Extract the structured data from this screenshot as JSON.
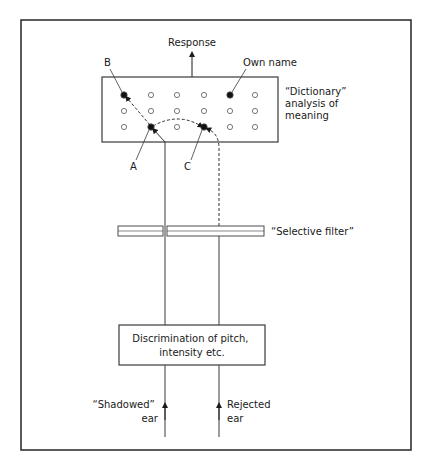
{
  "diagram": {
    "type": "Broadbent/Treisman selective attention model",
    "labels": {
      "response": "Response",
      "point_b": "B",
      "own_name": "Own name",
      "dictionary": [
        "“Dictionary”",
        "analysis of",
        "meaning"
      ],
      "point_a": "A",
      "point_c": "C",
      "selective_filter": "“Selective filter”",
      "discrimination": [
        "Discrimination of pitch,",
        "intensity etc."
      ],
      "shadowed_ear": [
        "“Shadowed”",
        "ear"
      ],
      "rejected_ear": [
        "Rejected",
        "ear"
      ]
    },
    "dictionary_grid": {
      "rows": 3,
      "cols": 6,
      "filled_nodes": [
        {
          "row": 0,
          "col": 0,
          "label": "B"
        },
        {
          "row": 0,
          "col": 4,
          "label": "Own name"
        },
        {
          "row": 2,
          "col": 1,
          "label": "A"
        },
        {
          "row": 2,
          "col": 3,
          "label": "C"
        }
      ]
    },
    "colors": {
      "stroke": "#3a3a3a",
      "frame": "#333333",
      "background": "#ffffff"
    }
  }
}
